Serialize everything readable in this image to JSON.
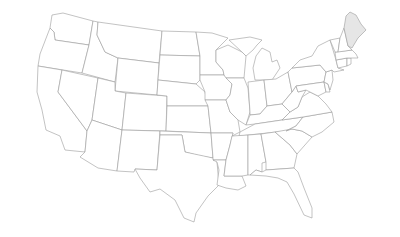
{
  "map": {
    "title": "United States",
    "highlighted_states": [
      "Maine"
    ],
    "colors": {
      "background": "#ffffff",
      "state_fill": "#ffffff",
      "state_stroke": "#9a9a9a",
      "highlight_fill": "#e6e6e6"
    },
    "states": [
      {
        "id": "WA",
        "name": "Washington",
        "d": "M52,15 L63,13 L93,21 L89,45 L55,40 L54,32 L50,28 Z"
      },
      {
        "id": "OR",
        "name": "Oregon",
        "d": "M50,28 L54,32 L55,40 L89,45 L82,73 L38,66 L40,54 Z"
      },
      {
        "id": "CA",
        "name": "California",
        "d": "M38,66 L62,70 L58,92 L87,131 L85,152 L65,150 L60,136 L46,130 L42,110 L37,92 Z"
      },
      {
        "id": "ID",
        "name": "Idaho",
        "d": "M93,21 L98,22 L97,35 L105,52 L118,58 L115,82 L82,73 L89,45 Z"
      },
      {
        "id": "NV",
        "name": "Nevada",
        "d": "M62,70 L98,78 L92,120 L87,131 L58,92 Z"
      },
      {
        "id": "MT",
        "name": "Montana",
        "d": "M98,22 L162,31 L159,63 L118,58 L105,52 L97,35 Z"
      },
      {
        "id": "WY",
        "name": "Wyoming",
        "d": "M118,58 L159,63 L157,95 L115,91 Z"
      },
      {
        "id": "UT",
        "name": "Utah",
        "d": "M98,78 L115,82 L115,91 L126,93 L122,130 L92,120 Z"
      },
      {
        "id": "AZ",
        "name": "Arizona",
        "d": "M92,120 L122,130 L117,171 L98,168 L80,157 L85,152 L87,131 Z"
      },
      {
        "id": "CO",
        "name": "Colorado",
        "d": "M126,93 L167,96 L166,131 L122,130 Z"
      },
      {
        "id": "NM",
        "name": "New Mexico",
        "d": "M122,130 L160,131 L157,170 L135,169 L134,172 L117,171 Z"
      },
      {
        "id": "ND",
        "name": "North Dakota",
        "d": "M162,31 L196,32 L200,56 L160,55 Z"
      },
      {
        "id": "SD",
        "name": "South Dakota",
        "d": "M160,55 L200,56 L200,80 L196,84 L158,80 Z"
      },
      {
        "id": "NE",
        "name": "Nebraska",
        "d": "M158,80 L196,84 L205,92 L208,106 L167,106 L167,96 L157,95 Z"
      },
      {
        "id": "KS",
        "name": "Kansas",
        "d": "M167,106 L208,106 L211,133 L166,131 Z"
      },
      {
        "id": "OK",
        "name": "Oklahoma",
        "d": "M160,131 L211,133 L213,158 L200,156 L185,152 L182,135 L160,135 Z"
      },
      {
        "id": "TX",
        "name": "Texas",
        "d": "M160,135 L182,135 L185,152 L213,158 L217,162 L219,185 L208,196 L196,213 L194,222 L184,218 L175,200 L160,189 L150,192 L140,178 L135,169 L157,170 Z"
      },
      {
        "id": "MN",
        "name": "Minnesota",
        "d": "M196,32 L212,33 L228,38 L216,50 L216,62 L223,70 L224,75 L200,75 L200,56 Z"
      },
      {
        "id": "IA",
        "name": "Iowa",
        "d": "M200,75 L224,75 L232,84 L230,95 L226,100 L205,100 L205,92 L200,80 Z"
      },
      {
        "id": "MO",
        "name": "Missouri",
        "d": "M205,100 L226,100 L230,112 L238,120 L240,132 L232,136 L233,133 L211,133 L208,106 Z"
      },
      {
        "id": "AR",
        "name": "Arkansas",
        "d": "M211,133 L233,133 L230,145 L226,160 L213,160 L213,158 Z"
      },
      {
        "id": "LA",
        "name": "Louisiana",
        "d": "M213,160 L226,160 L224,176 L242,176 L246,186 L238,190 L226,188 L217,185 L219,170 L217,162 Z"
      },
      {
        "id": "WI",
        "name": "Wisconsin",
        "d": "M216,50 L228,45 L242,52 L246,56 L244,78 L226,78 L224,75 L223,70 L216,62 Z"
      },
      {
        "id": "IL",
        "name": "Illinois",
        "d": "M226,78 L244,78 L248,88 L250,112 L246,125 L238,120 L230,112 L226,100 L230,95 L232,84 Z"
      },
      {
        "id": "MI",
        "name": "Michigan",
        "d": "M229,40 L250,37 L262,40 L257,45 L253,50 L246,56 L242,52 Z M256,56 L262,48 L270,52 L272,62 L277,60 L280,68 L272,80 L255,80 L253,68 Z"
      },
      {
        "id": "IN",
        "name": "Indiana",
        "d": "M248,82 L264,80 L267,106 L260,114 L250,115 L250,112 Z"
      },
      {
        "id": "OH",
        "name": "Ohio",
        "d": "M264,80 L276,79 L288,72 L292,92 L282,104 L267,106 Z"
      },
      {
        "id": "KY",
        "name": "Kentucky",
        "d": "M246,125 L250,115 L260,114 L267,106 L282,104 L290,112 L282,120 L255,124 Z"
      },
      {
        "id": "TN",
        "name": "Tennessee",
        "d": "M240,132 L255,124 L282,120 L303,117 L296,126 L286,131 L239,136 Z"
      },
      {
        "id": "MS",
        "name": "Mississippi",
        "d": "M232,136 L248,135 L248,175 L242,176 L224,176 L226,160 L230,145 Z"
      },
      {
        "id": "AL",
        "name": "Alabama",
        "d": "M248,135 L261,134 L266,162 L262,163 L262,172 L256,170 L250,175 L248,175 Z"
      },
      {
        "id": "GA",
        "name": "Georgia",
        "d": "M261,134 L275,132 L290,145 L297,154 L294,168 L266,170 L266,162 Z"
      },
      {
        "id": "FL",
        "name": "Florida",
        "d": "M250,175 L256,170 L262,172 L266,170 L294,168 L298,172 L304,188 L312,208 L312,218 L304,215 L294,194 L287,182 L278,178 L266,176 Z"
      },
      {
        "id": "SC",
        "name": "South Carolina",
        "d": "M275,132 L292,129 L302,131 L312,137 L297,154 L290,145 Z"
      },
      {
        "id": "NC",
        "name": "North Carolina",
        "d": "M286,131 L296,126 L303,117 L332,112 L334,122 L322,132 L312,137 L302,131 L292,129 Z"
      },
      {
        "id": "VA",
        "name": "Virginia",
        "d": "M282,120 L290,112 L298,107 L302,97 L310,92 L318,96 L326,104 L332,112 L303,117 Z"
      },
      {
        "id": "WV",
        "name": "West Virginia",
        "d": "M282,104 L292,92 L296,86 L298,92 L306,90 L302,97 L298,107 L290,112 Z"
      },
      {
        "id": "PA",
        "name": "Pennsylvania",
        "d": "M288,72 L292,68 L320,65 L326,72 L324,82 L296,86 L292,92 Z"
      },
      {
        "id": "MD",
        "name": "Maryland",
        "d": "M296,86 L324,82 L326,92 L318,96 L310,92 L306,90 L298,92 Z"
      },
      {
        "id": "DE",
        "name": "Delaware",
        "d": "M324,82 L328,84 L330,92 L326,92 Z"
      },
      {
        "id": "NJ",
        "name": "New Jersey",
        "d": "M326,72 L332,70 L333,80 L330,90 L328,84 L324,82 Z"
      },
      {
        "id": "NY",
        "name": "New York",
        "d": "M292,68 L300,60 L312,56 L318,46 L330,40 L336,60 L338,68 L344,70 L334,72 L332,70 L326,72 L320,65 Z"
      },
      {
        "id": "CT",
        "name": "Connecticut",
        "d": "M336,60 L347,58 L347,66 L338,68 Z"
      },
      {
        "id": "RI",
        "name": "Rhode Island",
        "d": "M347,58 L351,58 L351,64 L347,66 Z"
      },
      {
        "id": "MA",
        "name": "Massachusetts",
        "d": "M335,52 L352,50 L356,54 L358,58 L351,58 L347,58 L336,60 Z"
      },
      {
        "id": "VT",
        "name": "Vermont",
        "d": "M330,40 L340,38 L338,52 L335,52 Z"
      },
      {
        "id": "NH",
        "name": "New Hampshire",
        "d": "M340,38 L344,28 L348,46 L352,50 L338,52 Z"
      },
      {
        "id": "ME",
        "name": "Maine",
        "d": "M344,28 L346,16 L350,12 L356,15 L361,24 L366,30 L358,38 L352,48 L348,46 Z",
        "highlight": true
      }
    ]
  }
}
